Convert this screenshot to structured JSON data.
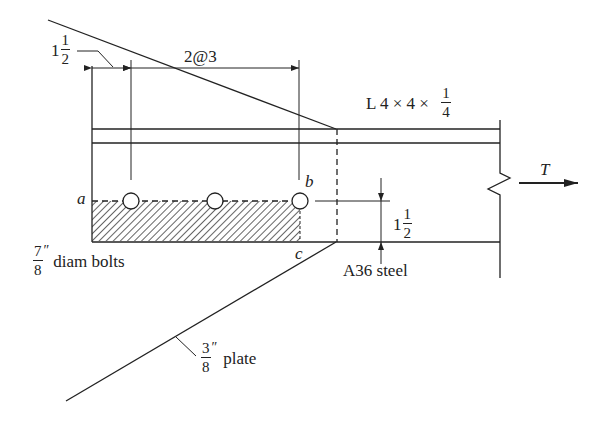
{
  "diagram": {
    "labels": {
      "edge_distance": {
        "whole": "1",
        "num": "1",
        "den": "2"
      },
      "bolt_spacing": "2@3",
      "angle_section": {
        "prefix": "L 4 × 4 × ",
        "num": "1",
        "den": "4"
      },
      "tension": "T",
      "point_a": "a",
      "point_b": "b",
      "point_c": "c",
      "gage": {
        "whole": "1",
        "num": "1",
        "den": "2"
      },
      "bolts": {
        "num": "7",
        "den": "8",
        "unit": "″",
        "text": "diam bolts"
      },
      "material": "A36 steel",
      "plate": {
        "num": "3",
        "den": "8",
        "unit": "″",
        "text": "plate"
      }
    },
    "bolts": [
      {
        "cx": 131,
        "cy": 201
      },
      {
        "cx": 215,
        "cy": 201
      },
      {
        "cx": 300,
        "cy": 201
      }
    ],
    "colors": {
      "line": "#222222",
      "background": "#ffffff"
    }
  }
}
